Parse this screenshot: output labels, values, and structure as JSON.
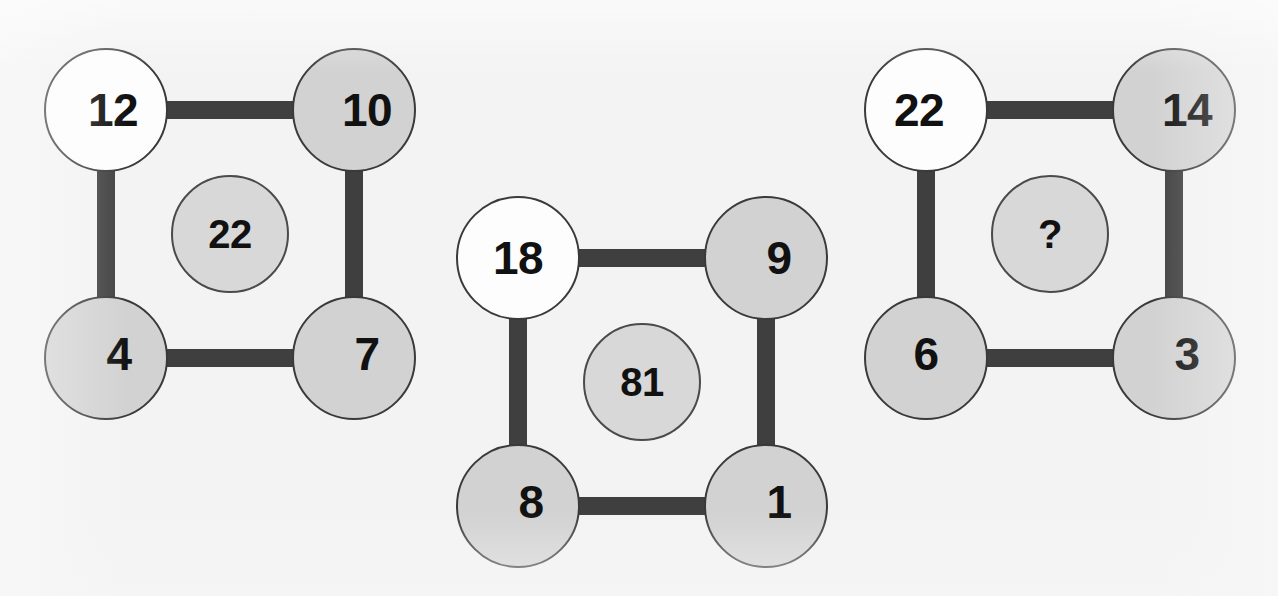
{
  "background_color": "#f3f3f3",
  "node_colors": {
    "blank_node_fill": "#fdfdfd",
    "filled_node_fill": "#d2d2d2",
    "center_node_fill": "#d8d8d8",
    "edge_color": "#3f3f3f",
    "outline_color": "#3a3a3a",
    "text_color": "#111111"
  },
  "puzzles": [
    {
      "id": "puzzle-1",
      "top_left": "12",
      "top_right": "10",
      "bottom_left": "4",
      "bottom_right": "7",
      "center": "22"
    },
    {
      "id": "puzzle-2",
      "top_left": "18",
      "top_right": "9",
      "bottom_left": "8",
      "bottom_right": "1",
      "center": "81"
    },
    {
      "id": "puzzle-3",
      "top_left": "22",
      "top_right": "14",
      "bottom_left": "6",
      "bottom_right": "3",
      "center": "?"
    }
  ]
}
